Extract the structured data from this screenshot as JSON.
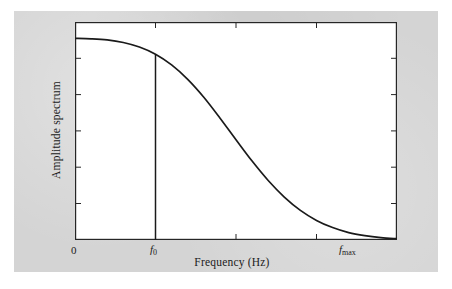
{
  "figure": {
    "background_color": "#ffffff",
    "page_color": "#d4d4d4",
    "plot_background": "#ffffff",
    "axis_color": "#262626",
    "curve_color": "#1a1a1a"
  },
  "axes": {
    "x_title": "Frequency (Hz)",
    "y_title": "Amplitude spectrum",
    "x_tick_labels": [
      "0",
      "f",
      "f"
    ],
    "x_tick_0": "0",
    "x_tick_f0_symbol": "f",
    "x_tick_f0_sub": "0",
    "x_tick_fmax_symbol": "f",
    "x_tick_fmax_sub": "max"
  },
  "bleed_text": {
    "line1": "introduction to",
    "line2": "signal processing",
    "line3": "4.1"
  },
  "chart_data": {
    "type": "line",
    "title": "",
    "xlabel": "Frequency (Hz)",
    "ylabel": "Amplitude spectrum",
    "xlim": [
      0,
      1
    ],
    "ylim": [
      0,
      1
    ],
    "grid": false,
    "legend": null,
    "x_ticks": [
      0,
      0.25,
      0.5,
      0.75,
      1
    ],
    "x_tick_labels": [
      "0",
      "f0",
      "",
      "",
      "fmax"
    ],
    "y_ticks": [
      0,
      0.2,
      0.4,
      0.6,
      0.8,
      1
    ],
    "y_tick_labels": [
      "",
      "",
      "",
      "",
      "",
      ""
    ],
    "series": [
      {
        "name": "Amplitude spectrum",
        "x": [
          0.0,
          0.05,
          0.1,
          0.15,
          0.2,
          0.25,
          0.3,
          0.35,
          0.4,
          0.45,
          0.5,
          0.55,
          0.6,
          0.65,
          0.7,
          0.75,
          0.8,
          0.85,
          0.9,
          0.95,
          1.0
        ],
        "y": [
          0.925,
          0.923,
          0.918,
          0.906,
          0.885,
          0.852,
          0.803,
          0.737,
          0.655,
          0.56,
          0.46,
          0.362,
          0.273,
          0.197,
          0.136,
          0.09,
          0.057,
          0.034,
          0.02,
          0.011,
          0.006
        ]
      }
    ],
    "annotations": [
      {
        "type": "vertical-line",
        "name": "f0-marker",
        "x": 0.25,
        "y_from": 0.0,
        "y_to": 0.852,
        "label": "f0"
      }
    ]
  }
}
